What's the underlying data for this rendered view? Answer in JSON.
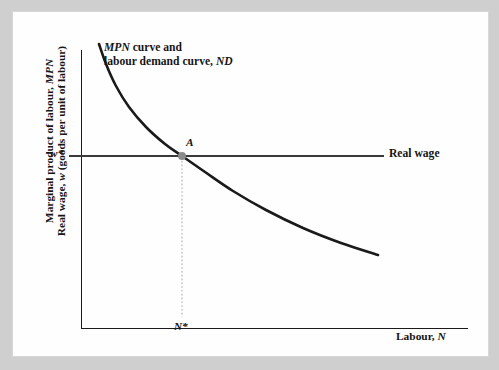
{
  "figure": {
    "background_color": "#cfcfcf",
    "card_color": "#fefefe",
    "ink_color": "#1a1a1a"
  },
  "chart_data": {
    "type": "line",
    "title": "",
    "subtitle": "",
    "xlabel_line": "Labour, ",
    "xlabel_italic": "N",
    "ylabel_line1_plain": "Marginal product of labour, ",
    "ylabel_line1_italic": "MPN",
    "ylabel_line2_a": "Real wage, ",
    "ylabel_line2_italic": "w",
    "ylabel_line2_b": " (goods per unit of labour)",
    "grid": false,
    "legend_position": "none",
    "axis_ranges": {
      "x": [
        0,
        100
      ],
      "y": [
        0,
        100
      ]
    },
    "series": [
      {
        "name": "MPN curve and labour demand curve, ND",
        "type": "curve",
        "style": "solid",
        "color": "#1a1a1a",
        "width": 2.6,
        "points": [
          [
            99,
            44
          ],
          [
            106,
            64
          ],
          [
            116,
            86
          ],
          [
            129,
            107
          ],
          [
            146,
            127
          ],
          [
            165,
            144
          ],
          [
            182,
            156
          ],
          [
            205,
            172
          ],
          [
            233,
            191
          ],
          [
            266,
            210
          ],
          [
            303,
            228
          ],
          [
            341,
            243
          ],
          [
            378,
            255
          ]
        ]
      },
      {
        "name": "Real wage",
        "type": "horizontal-line",
        "style": "solid",
        "color": "#3a3a3a",
        "width": 2.0,
        "y": 156,
        "x_start": 69,
        "x_end": 384
      },
      {
        "name": "N-star guide",
        "type": "vertical-dotted",
        "style": "dotted",
        "color": "#b4b4b4",
        "width": 1.2,
        "x": 182,
        "y_start": 157,
        "y_end": 317
      }
    ],
    "annotations": [
      {
        "name": "curve-caption",
        "line1_italic": "MPN",
        "line1_plain": " curve and",
        "line2_plain": "labour demand curve, ",
        "line2_italic": "ND"
      },
      {
        "name": "equilibrium-point",
        "label": "A",
        "x": 182,
        "y": 156,
        "marker": "filled-circle",
        "marker_color": "#8a8a8a",
        "marker_radius": 4
      },
      {
        "name": "real-wage-line-label",
        "label": "Real wage"
      },
      {
        "name": "w-star-tick",
        "label": "w*"
      },
      {
        "name": "n-star-tick",
        "label": "N*"
      }
    ]
  },
  "labels": {
    "curve_caption_line1_italic": "MPN",
    "curve_caption_line1_plain": " curve and",
    "curve_caption_line2_plain": "labour demand curve, ",
    "curve_caption_line2_italic": "ND",
    "real_wage": "Real wage",
    "point_a": "A",
    "w_star": "w*",
    "n_star": "N*",
    "xaxis_plain": "Labour, ",
    "xaxis_italic": "N",
    "yaxis_line1_plain": "Marginal product of labour, ",
    "yaxis_line1_italic": "MPN",
    "yaxis_line2_a": "Real wage, ",
    "yaxis_line2_italic": "w",
    "yaxis_line2_b": " (goods per unit of labour)"
  }
}
